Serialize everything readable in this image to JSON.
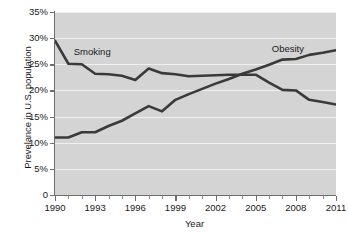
{
  "chart_data": {
    "type": "line",
    "title": "",
    "xlabel": "Year",
    "ylabel": "Prevelance in U.S. population",
    "xlim": [
      1990,
      2011
    ],
    "ylim": [
      0,
      35
    ],
    "grid": true,
    "legend_position": "inline-labels",
    "x": [
      1990,
      1991,
      1992,
      1993,
      1994,
      1995,
      1996,
      1997,
      1998,
      1999,
      2000,
      2001,
      2002,
      2003,
      2004,
      2005,
      2006,
      2007,
      2008,
      2009,
      2010,
      2011
    ],
    "xticks": [
      1990,
      1993,
      1996,
      1999,
      2002,
      2005,
      2008,
      2011
    ],
    "xtick_labels": [
      "1990",
      "1993",
      "1996",
      "1999",
      "2002",
      "2005",
      "2008",
      "2011"
    ],
    "yticks": [
      0,
      5,
      10,
      15,
      20,
      25,
      30,
      35
    ],
    "ytick_labels": [
      "0",
      "5%",
      "10%",
      "15%",
      "20%",
      "25%",
      "30%",
      "35%"
    ],
    "series": [
      {
        "name": "Smoking",
        "color": "#3a3a3a",
        "values": [
          29.5,
          25.1,
          25.0,
          23.2,
          23.1,
          22.8,
          22.0,
          24.2,
          23.3,
          23.1,
          22.7,
          22.8,
          22.9,
          23.0,
          23.0,
          23.0,
          21.5,
          20.1,
          20.0,
          18.2,
          17.8,
          17.3
        ]
      },
      {
        "name": "Obesity",
        "color": "#3a3a3a",
        "values": [
          11.0,
          11.0,
          12.0,
          12.0,
          13.2,
          14.2,
          15.6,
          17.0,
          16.0,
          18.2,
          19.3,
          20.3,
          21.3,
          22.2,
          23.2,
          24.0,
          24.9,
          25.9,
          26.0,
          26.8,
          27.2,
          27.7
        ]
      }
    ],
    "annotations": [
      {
        "text": "Smoking",
        "x": 1991.4,
        "y": 27.4
      },
      {
        "text": "Obesity",
        "x": 2006.2,
        "y": 27.9
      }
    ]
  }
}
